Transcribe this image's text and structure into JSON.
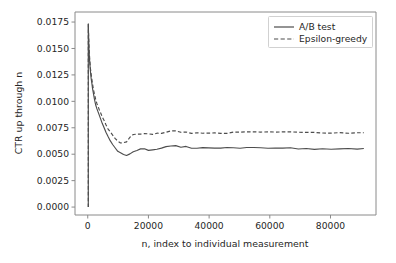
{
  "chart_data": {
    "type": "line",
    "title": "",
    "xlabel": "n, index to individual measurement",
    "ylabel": "CTR up through n",
    "xlim": [
      -4200,
      95000
    ],
    "ylim": [
      -0.00075,
      0.01845
    ],
    "grid": false,
    "legend_position": "upper right",
    "xticks": [
      0,
      20000,
      40000,
      60000,
      80000
    ],
    "xtick_labels": [
      "0",
      "20000",
      "40000",
      "60000",
      "80000"
    ],
    "yticks": [
      0.0,
      0.0025,
      0.005,
      0.0075,
      0.01,
      0.0125,
      0.015,
      0.0175
    ],
    "ytick_labels": [
      "0.0000",
      "0.0025",
      "0.0050",
      "0.0075",
      "0.0100",
      "0.0125",
      "0.0150",
      "0.0175"
    ],
    "series": [
      {
        "name": "A/B test",
        "style": "solid",
        "color": "#4d4d4d",
        "x": [
          180,
          300,
          420,
          560,
          700,
          900,
          1100,
          1350,
          1600,
          1900,
          2200,
          2600,
          3000,
          3400,
          3800,
          4300,
          4800,
          5400,
          6000,
          6700,
          7400,
          8200,
          9000,
          9900,
          10800,
          11800,
          12800,
          13900,
          15000,
          16200,
          17400,
          18700,
          20000,
          21400,
          22800,
          24300,
          25800,
          27400,
          29000,
          30700,
          32400,
          34200,
          36000,
          37900,
          39800,
          41800,
          43800,
          45900,
          48000,
          50200,
          52400,
          54700,
          57000,
          59400,
          61800,
          64300,
          66800,
          69400,
          72000,
          74700,
          77400,
          80200,
          83000,
          85900,
          88800,
          91000
        ],
        "y": [
          0.0173,
          0.016,
          0.0149,
          0.0141,
          0.0135,
          0.0128,
          0.0122,
          0.0117,
          0.0112,
          0.0107,
          0.0102,
          0.0097,
          0.0093,
          0.009,
          0.0087,
          0.0083,
          0.0079,
          0.0075,
          0.0071,
          0.0067,
          0.0063,
          0.0059,
          0.0056,
          0.0053,
          0.0051,
          0.005,
          0.0049,
          0.005,
          0.0052,
          0.0054,
          0.0055,
          0.0055,
          0.0054,
          0.0054,
          0.0055,
          0.0056,
          0.0057,
          0.0058,
          0.0058,
          0.0057,
          0.0057,
          0.0056,
          0.0056,
          0.0056,
          0.0056,
          0.0056,
          0.0056,
          0.0056,
          0.0056,
          0.0056,
          0.0056,
          0.0056,
          0.0056,
          0.0056,
          0.0056,
          0.0056,
          0.0056,
          0.0055,
          0.0055,
          0.0055,
          0.0055,
          0.0055,
          0.0055,
          0.0055,
          0.0055,
          0.0055
        ]
      },
      {
        "name": "Epsilon-greedy",
        "style": "dashed",
        "color": "#4d4d4d",
        "x": [
          180,
          300,
          420,
          560,
          700,
          900,
          1100,
          1350,
          1600,
          1900,
          2200,
          2600,
          3000,
          3400,
          3800,
          4300,
          4800,
          5400,
          6000,
          6700,
          7400,
          8200,
          9000,
          9900,
          10800,
          11800,
          12800,
          13900,
          15000,
          16200,
          17400,
          18700,
          20000,
          21400,
          22800,
          24300,
          25800,
          27400,
          29000,
          30700,
          32400,
          34200,
          36000,
          37900,
          39800,
          41800,
          43800,
          45900,
          48000,
          50200,
          52400,
          54700,
          57000,
          59400,
          61800,
          64300,
          66800,
          69400,
          72000,
          74700,
          77400,
          80200,
          83000,
          85900,
          88800,
          91000
        ],
        "y": [
          0.0173,
          0.0161,
          0.0151,
          0.0144,
          0.0138,
          0.0131,
          0.0126,
          0.0121,
          0.0116,
          0.0111,
          0.0107,
          0.0102,
          0.0098,
          0.0095,
          0.0092,
          0.0089,
          0.0085,
          0.0082,
          0.0078,
          0.0074,
          0.0071,
          0.0068,
          0.0065,
          0.0062,
          0.0061,
          0.0061,
          0.0062,
          0.0066,
          0.0069,
          0.0069,
          0.0069,
          0.0069,
          0.0069,
          0.0069,
          0.007,
          0.007,
          0.0071,
          0.0072,
          0.0072,
          0.0071,
          0.0071,
          0.007,
          0.007,
          0.007,
          0.007,
          0.007,
          0.007,
          0.007,
          0.0071,
          0.0071,
          0.0071,
          0.0071,
          0.0071,
          0.0071,
          0.0071,
          0.0071,
          0.0071,
          0.0071,
          0.0071,
          0.0071,
          0.007,
          0.007,
          0.007,
          0.007,
          0.007,
          0.007
        ]
      }
    ],
    "initial_spike": {
      "note": "near-vertical rise from 0 at n=0 up to peak",
      "x": 180,
      "y_from": 0.0,
      "y_to": 0.0173
    }
  }
}
